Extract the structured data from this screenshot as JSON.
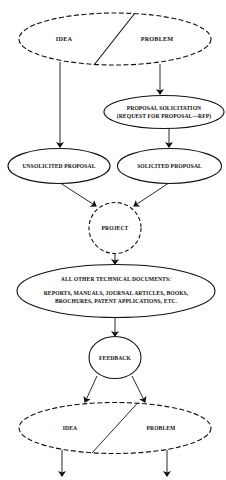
{
  "diagram": {
    "type": "flowchart",
    "colors": {
      "stroke": "#111111",
      "background": "#ffffff"
    },
    "nodes": {
      "top_idea_problem": {
        "left": "IDEA",
        "right": "PROBLEM",
        "style": "dashed-ellipse"
      },
      "proposal_solicitation": {
        "line1": "PROPOSAL SOLICITATION",
        "line2": "(REQUEST FOR PROPOSAL—RFP)",
        "style": "solid-ellipse"
      },
      "unsolicited_proposal": {
        "label": "UNSOLICITED PROPOSAL",
        "style": "solid-ellipse"
      },
      "solicited_proposal": {
        "label": "SOLICITED PROPOSAL",
        "style": "solid-ellipse"
      },
      "project": {
        "label": "PROJECT",
        "style": "dashed-circle"
      },
      "technical_documents": {
        "line1": "ALL OTHER TECHNICAL DOCUMENTS:",
        "line2": "REPORTS, MANUALS, JOURNAL ARTICLES, BOOKS,",
        "line3": "BROCHURES, PATENT APPLICATIONS, ETC.",
        "style": "solid-ellipse"
      },
      "feedback": {
        "label": "FEEDBACK",
        "style": "solid-circle"
      },
      "bottom_idea_problem": {
        "left": "IDEA",
        "right": "PROBLEM",
        "style": "dashed-ellipse"
      }
    },
    "edges": [
      {
        "from": "top_idea_problem.problem",
        "to": "proposal_solicitation"
      },
      {
        "from": "top_idea_problem.idea",
        "to": "unsolicited_proposal"
      },
      {
        "from": "proposal_solicitation",
        "to": "solicited_proposal"
      },
      {
        "from": "unsolicited_proposal",
        "to": "project"
      },
      {
        "from": "solicited_proposal",
        "to": "project"
      },
      {
        "from": "project",
        "to": "technical_documents"
      },
      {
        "from": "technical_documents",
        "to": "feedback"
      },
      {
        "from": "feedback",
        "to": "bottom_idea_problem.idea"
      },
      {
        "from": "feedback",
        "to": "bottom_idea_problem.problem"
      },
      {
        "from": "bottom_idea_problem.idea",
        "to": "continues-down"
      },
      {
        "from": "bottom_idea_problem.problem",
        "to": "continues-down"
      }
    ]
  }
}
